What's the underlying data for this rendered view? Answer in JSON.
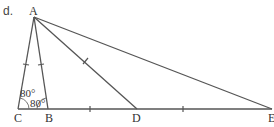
{
  "diagram": {
    "part_label": "d.",
    "points": {
      "A": {
        "label": "A",
        "x": 34,
        "y": 17
      },
      "C": {
        "label": "C",
        "x": 18,
        "y": 109
      },
      "B": {
        "label": "B",
        "x": 48,
        "y": 109
      },
      "D": {
        "label": "D",
        "x": 137,
        "y": 109
      },
      "E": {
        "label": "E",
        "x": 272,
        "y": 109
      }
    },
    "segments": [
      "AC",
      "AB",
      "AD",
      "AE",
      "CE"
    ],
    "equal_marks": [
      "AC",
      "AB",
      "AD",
      "BD",
      "DE"
    ],
    "angles": [
      {
        "vertex": "C",
        "label": "80°"
      },
      {
        "vertex": "B",
        "label": "80°"
      }
    ],
    "colors": {
      "stroke": "#555555",
      "text": "#333333",
      "background": "#ffffff"
    }
  }
}
